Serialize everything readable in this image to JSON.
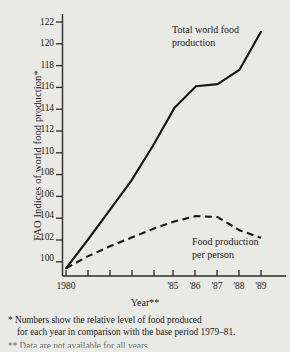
{
  "chart_data": {
    "type": "line",
    "title": "",
    "xlabel": "Year**",
    "ylabel": "FAO Indices of world food production*",
    "ylim": [
      98.6,
      123.2
    ],
    "xlim": [
      1979.6,
      1989.6
    ],
    "yticks": [
      100,
      102,
      104,
      106,
      108,
      110,
      112,
      114,
      116,
      118,
      120,
      122
    ],
    "ytick_labels": [
      "100",
      "102",
      "104",
      "106",
      "108",
      "110",
      "112",
      "114",
      "116",
      "118",
      "120",
      "122"
    ],
    "xticks": [
      1980,
      1981,
      1982,
      1983,
      1984,
      1985,
      1986,
      1987,
      1988,
      1989
    ],
    "xtick_labels": [
      "1980",
      "",
      "",
      "",
      "",
      "'85",
      "'86",
      "'87",
      "'88",
      "'89"
    ],
    "grid": false,
    "legend": "inline-annotations",
    "x": [
      1980,
      1981,
      1982,
      1983,
      1984,
      1985,
      1986,
      1987,
      1988,
      1989
    ],
    "series": [
      {
        "name": "Total world food production",
        "style": "solid",
        "color": "#151515",
        "values": [
          99.4,
          102.0,
          104.7,
          107.4,
          110.6,
          114.1,
          116.1,
          116.3,
          117.6,
          121.1
        ]
      },
      {
        "name": "Food production per person",
        "style": "dashed",
        "color": "#151515",
        "values": [
          99.4,
          100.5,
          101.4,
          102.2,
          103.0,
          103.7,
          104.2,
          104.1,
          102.9,
          102.2
        ]
      }
    ],
    "annotations": [
      {
        "id": "total",
        "text": "Total world food production",
        "lines": [
          "Total world food",
          "production"
        ]
      },
      {
        "id": "person",
        "text": "Food production per person",
        "lines": [
          "Food production",
          "per person"
        ]
      }
    ]
  },
  "axes": {
    "y_title": "FAO Indices of world food production*",
    "x_title": "Year**"
  },
  "notes": {
    "note1_lead": "* Numbers show the relative level of food produced",
    "note1_cont": "for each year in comparison with the base period 1979–81.",
    "note2_clipped": "** Data are not available for all years."
  }
}
